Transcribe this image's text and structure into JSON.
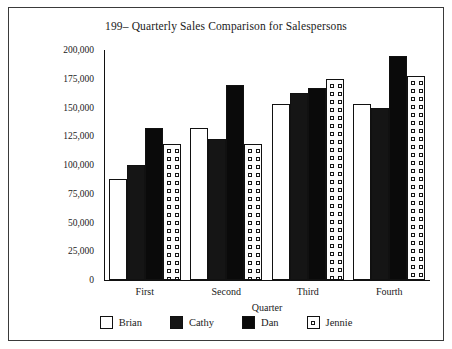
{
  "chart_data": {
    "type": "bar",
    "title": "199– Quarterly Sales Comparison for Salespersons",
    "xlabel": "Quarter",
    "ylabel": "Sales/Units Sold",
    "categories": [
      "First",
      "Second",
      "Third",
      "Fourth"
    ],
    "ylim": [
      0,
      200000
    ],
    "ytick_values": [
      0,
      25000,
      50000,
      75000,
      100000,
      125000,
      150000,
      175000,
      200000
    ],
    "ytick_labels": [
      "0",
      "25,000",
      "50,000",
      "75,000",
      "100,000",
      "125,000",
      "150,000",
      "175,000",
      "200,000"
    ],
    "grid": false,
    "legend_position": "bottom",
    "series": [
      {
        "name": "Brian",
        "fill": "empty",
        "values": [
          87500,
          132500,
          153000,
          153000
        ]
      },
      {
        "name": "Cathy",
        "fill": "cross",
        "values": [
          100000,
          123000,
          163000,
          150000
        ]
      },
      {
        "name": "Dan",
        "fill": "solid",
        "values": [
          132500,
          170000,
          167000,
          195000
        ]
      },
      {
        "name": "Jennie",
        "fill": "dots",
        "values": [
          118000,
          118000,
          175000,
          177000
        ]
      }
    ]
  },
  "colors": {
    "ink": "#1a1a1a",
    "axis": "#111111",
    "solid_fill": "#0a0a0a",
    "empty_fill": "#ffffff",
    "background": "#ffffff",
    "frame": "#3a3a3a"
  }
}
